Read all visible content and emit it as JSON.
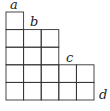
{
  "diagram": {
    "type": "young-diagram",
    "row_lengths": [
      1,
      3,
      3,
      5,
      5
    ],
    "labels": [
      {
        "text": "a",
        "x": 10,
        "y": 9
      },
      {
        "text": "b",
        "x": 30,
        "y": 26
      },
      {
        "text": "c",
        "x": 66,
        "y": 62
      },
      {
        "text": "d",
        "x": 99,
        "y": 99
      }
    ],
    "cell_size": 17.6,
    "origin": {
      "x": 6,
      "y": 12
    },
    "line_color": "#333333"
  }
}
